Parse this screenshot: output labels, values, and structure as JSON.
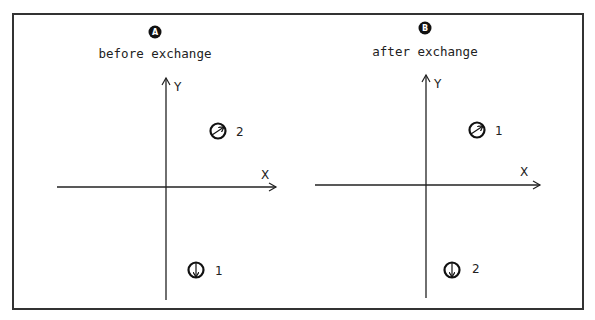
{
  "panels": [
    {
      "id": "A",
      "badge": "A",
      "title": "before exchange",
      "x_label": "X",
      "y_label": "Y",
      "particles": [
        {
          "label": "2",
          "spin": "up-right",
          "quadrant": "upper-right"
        },
        {
          "label": "1",
          "spin": "down",
          "quadrant": "lower-right"
        }
      ]
    },
    {
      "id": "B",
      "badge": "B",
      "title": "after exchange",
      "x_label": "X",
      "y_label": "Y",
      "particles": [
        {
          "label": "1",
          "spin": "up-right",
          "quadrant": "upper-right"
        },
        {
          "label": "2",
          "spin": "down",
          "quadrant": "lower-right"
        }
      ]
    }
  ],
  "colors": {
    "ink": "#222222",
    "frame": "#333333",
    "background": "#ffffff"
  }
}
